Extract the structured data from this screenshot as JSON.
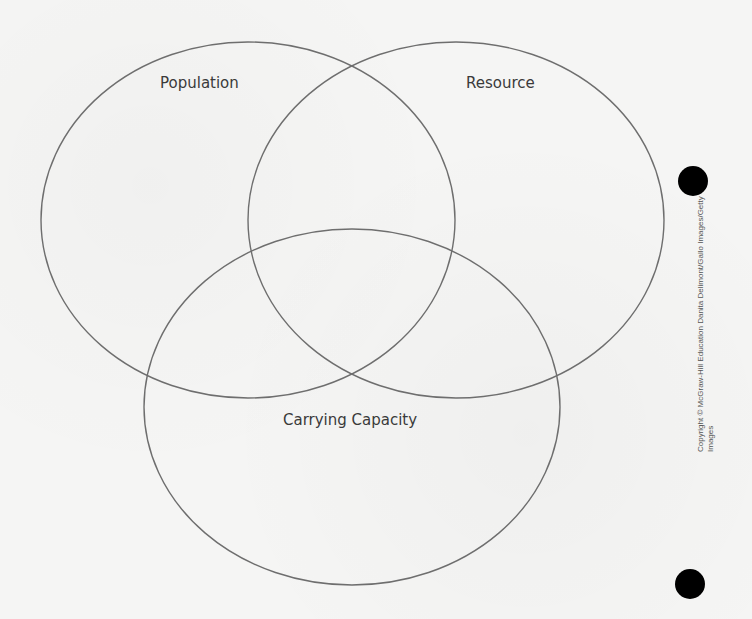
{
  "diagram": {
    "type": "venn",
    "sets": [
      {
        "id": "population",
        "label": "Population"
      },
      {
        "id": "resource",
        "label": "Resource"
      },
      {
        "id": "carrying_capacity",
        "label": "Carrying Capacity"
      }
    ],
    "stroke_color": "#6e6e6e"
  },
  "credit": {
    "line1": "Copyright © McGraw-Hill Education   Danita Delimont/Gallo Images/Getty",
    "line2": "Images"
  }
}
